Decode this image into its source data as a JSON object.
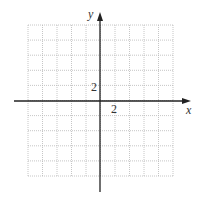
{
  "chart_data": {
    "type": "scatter",
    "title": "",
    "xlabel": "x",
    "ylabel": "y",
    "xlim": [
      -10,
      10
    ],
    "ylim": [
      -10,
      10
    ],
    "grid": true,
    "grid_step": 2,
    "tick_labels": {
      "x": "2",
      "y": "2"
    },
    "points": [],
    "legend": null
  },
  "axes": {
    "x_label": "x",
    "y_label": "y",
    "x_tick": "2",
    "y_tick": "2"
  },
  "colors": {
    "axis": "#222222",
    "grid": "#b8b8b8",
    "text": "#333333"
  }
}
